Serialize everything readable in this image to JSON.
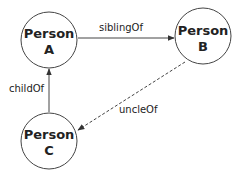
{
  "diagram": {
    "nodes": [
      {
        "id": "A",
        "line1": "Person",
        "line2": "A"
      },
      {
        "id": "B",
        "line1": "Person",
        "line2": "B"
      },
      {
        "id": "C",
        "line1": "Person",
        "line2": "C"
      }
    ],
    "edges": [
      {
        "from": "A",
        "to": "B",
        "label": "siblingOf",
        "style": "solid"
      },
      {
        "from": "C",
        "to": "A",
        "label": "childOf",
        "style": "solid"
      },
      {
        "from": "B",
        "to": "C",
        "label": "uncleOf",
        "style": "dashed"
      }
    ]
  }
}
